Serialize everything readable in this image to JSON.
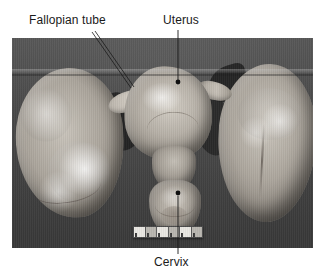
{
  "figure": {
    "type": "gross-pathology-photograph",
    "background_color": "#ffffff",
    "photo": {
      "x": 12,
      "y": 38,
      "width": 301,
      "height": 210,
      "background_color": "#4b4b4b",
      "border_color": "#3f3f3f"
    }
  },
  "labels": [
    {
      "id": "fallopian-tube",
      "text": "Fallopian tube",
      "text_x": 29,
      "text_y": 14,
      "color": "#1a1a1a",
      "leader": {
        "style": "double-line",
        "x1": 92,
        "y1": 32,
        "x2": 131,
        "y2": 88,
        "marker": "none"
      }
    },
    {
      "id": "uterus",
      "text": "Uterus",
      "text_x": 163,
      "text_y": 14,
      "color": "#1a1a1a",
      "leader": {
        "style": "single-line",
        "x1": 178,
        "y1": 30,
        "x2": 178,
        "y2": 81,
        "marker": "dot"
      }
    },
    {
      "id": "cervix",
      "text": "Cervix",
      "text_x": 154,
      "text_y": 256,
      "color": "#1a1a1a",
      "leader": {
        "style": "single-line",
        "x1": 178,
        "y1": 254,
        "x2": 178,
        "y2": 194,
        "marker": "dot"
      }
    }
  ],
  "structures": [
    {
      "id": "left-ovarian-mass",
      "name": "Left ovarian mass",
      "tone": "pale-tan"
    },
    {
      "id": "right-ovarian-mass",
      "name": "Right ovarian mass",
      "tone": "pale-tan"
    },
    {
      "id": "uterus-body",
      "name": "Uterus",
      "tone": "pale-tan"
    },
    {
      "id": "cervix-body",
      "name": "Cervix",
      "tone": "pale-tan"
    }
  ],
  "scale_bar": {
    "name": "ruler",
    "x": 121,
    "y": 188,
    "width": 68,
    "height": 10,
    "segments": 6,
    "fill_color": "#e9e7e2",
    "tick_color": "#3a3a3a"
  }
}
